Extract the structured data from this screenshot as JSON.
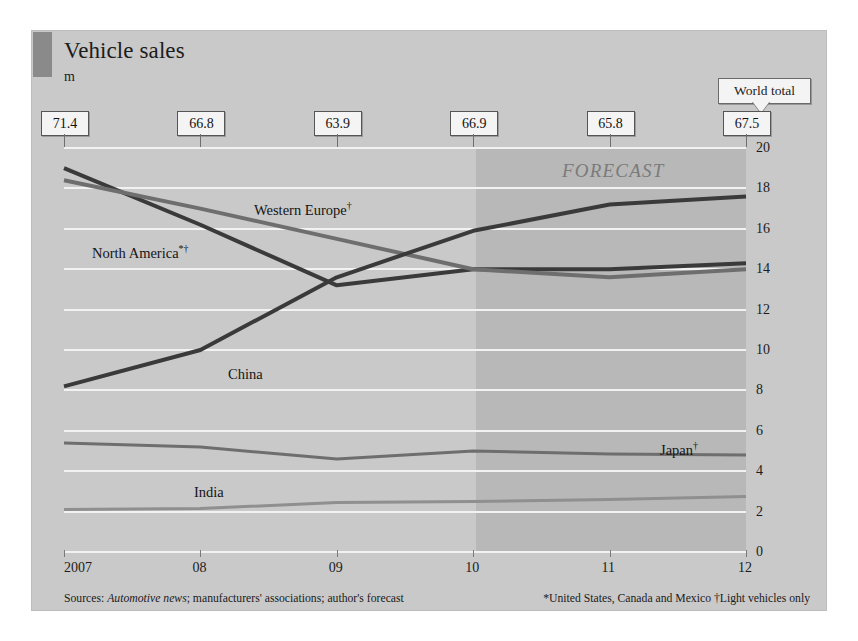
{
  "title": "Vehicle sales",
  "units": "m",
  "world_total_label": "World total",
  "footnote_left": "Sources: Automotive news; manufacturers' associations; author's forecast",
  "footnote_left_italic": "Automotive news",
  "footnote_right": "*United States, Canada and Mexico †Light vehicles only",
  "colors": {
    "panel_background": "#c9c9c9",
    "forecast_band": "#a8a8a8",
    "gridline": "#f2f2f2",
    "dark_series": "#3a3a3a",
    "mid_series": "#6e6e6e",
    "light_series": "#8f8f8f",
    "text": "#1c1c1c",
    "callout_fill": "#f4f4f4"
  },
  "series_labels": {
    "western_europe": "Western Europe",
    "north_america": "North America",
    "china": "China",
    "japan": "Japan",
    "india": "India",
    "western_europe_sup": "†",
    "north_america_sup": "*†",
    "japan_sup": "†"
  },
  "forecast_label": "FORECAST",
  "chart_data": {
    "type": "line",
    "title": "Vehicle sales",
    "subtitle": "m",
    "xlabel": "",
    "ylabel": "m",
    "ylim": [
      0,
      20
    ],
    "yticks": [
      0,
      2,
      4,
      6,
      8,
      10,
      12,
      14,
      16,
      18,
      20
    ],
    "grid": true,
    "legend": "inline-labels",
    "categories": [
      "2007",
      "08",
      "09",
      "10",
      "11",
      "12"
    ],
    "xticklabels": [
      "2007",
      "08",
      "09",
      "10",
      "11",
      "12"
    ],
    "world_totals": [
      "71.4",
      "66.8",
      "63.9",
      "66.9",
      "65.8",
      "67.5"
    ],
    "world_totals_values": [
      71.4,
      66.8,
      63.9,
      66.9,
      65.8,
      67.5
    ],
    "forecast_starts_at": "10",
    "annotations": [
      "FORECAST",
      "World total"
    ],
    "series": [
      {
        "name": "North America*†",
        "color": "#3a3a3a",
        "values": [
          19.0,
          16.2,
          13.2,
          14.0,
          14.0,
          14.3
        ]
      },
      {
        "name": "Western Europe†",
        "color": "#6e6e6e",
        "values": [
          18.4,
          17.0,
          15.5,
          14.0,
          13.6,
          14.0
        ]
      },
      {
        "name": "China",
        "color": "#3a3a3a",
        "values": [
          8.2,
          10.0,
          13.6,
          15.9,
          17.2,
          17.6
        ]
      },
      {
        "name": "Japan†",
        "color": "#6e6e6e",
        "values": [
          5.4,
          5.2,
          4.6,
          5.0,
          4.85,
          4.8
        ]
      },
      {
        "name": "India",
        "color": "#8f8f8f",
        "values": [
          2.1,
          2.15,
          2.45,
          2.5,
          2.6,
          2.75
        ]
      }
    ]
  }
}
